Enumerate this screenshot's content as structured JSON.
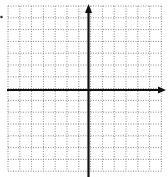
{
  "diagram": {
    "type": "coordinate-plane",
    "grid": {
      "x_start": 8,
      "y_start": 6,
      "spacing": 11.8,
      "columns": 13,
      "rows": 14,
      "line_style": "dotted",
      "line_color": "#8a8a8a"
    },
    "axes": {
      "x_axis": {
        "y": 90,
        "x_from": 7,
        "x_to": 166,
        "arrow": "right"
      },
      "y_axis": {
        "x": 88.5,
        "y_from": 4,
        "y_to": 177,
        "arrow": "up"
      },
      "color": "#111111",
      "width": 2.2
    },
    "stray_mark": {
      "x": 1.5,
      "y": 17
    }
  }
}
